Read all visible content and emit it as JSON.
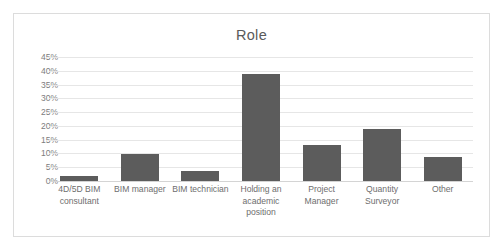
{
  "chart_data": {
    "type": "bar",
    "title": "Role",
    "xlabel": "",
    "ylabel": "",
    "categories": [
      "4D/5D BIM consultant",
      "BIM manager",
      "BIM technician",
      "Holding an academic position",
      "Project Manager",
      "Quantity Surveyor",
      "Other"
    ],
    "values": [
      2,
      9.8,
      3.7,
      39,
      13,
      18.7,
      8.7
    ],
    "value_labels": [
      "2%",
      "9.8%",
      "3.7%",
      "39%",
      "13%",
      "18.7%",
      "8.7%"
    ],
    "ylim": [
      0,
      45
    ],
    "ytick_values": [
      0,
      5,
      10,
      15,
      20,
      25,
      30,
      35,
      40,
      45
    ],
    "ytick_labels": [
      "0%",
      "5%",
      "10%",
      "15%",
      "20%",
      "25%",
      "30%",
      "35%",
      "40%",
      "45%"
    ],
    "grid": true,
    "legend": false,
    "legend_position": "none",
    "series_color": "#5c5c5c",
    "gridline_color": "#e6e6e6",
    "axis_text_color": "#7c7c7c",
    "title_color": "#5a5a5a",
    "border_color": "#dcdcdc",
    "background_color": "#ffffff"
  }
}
